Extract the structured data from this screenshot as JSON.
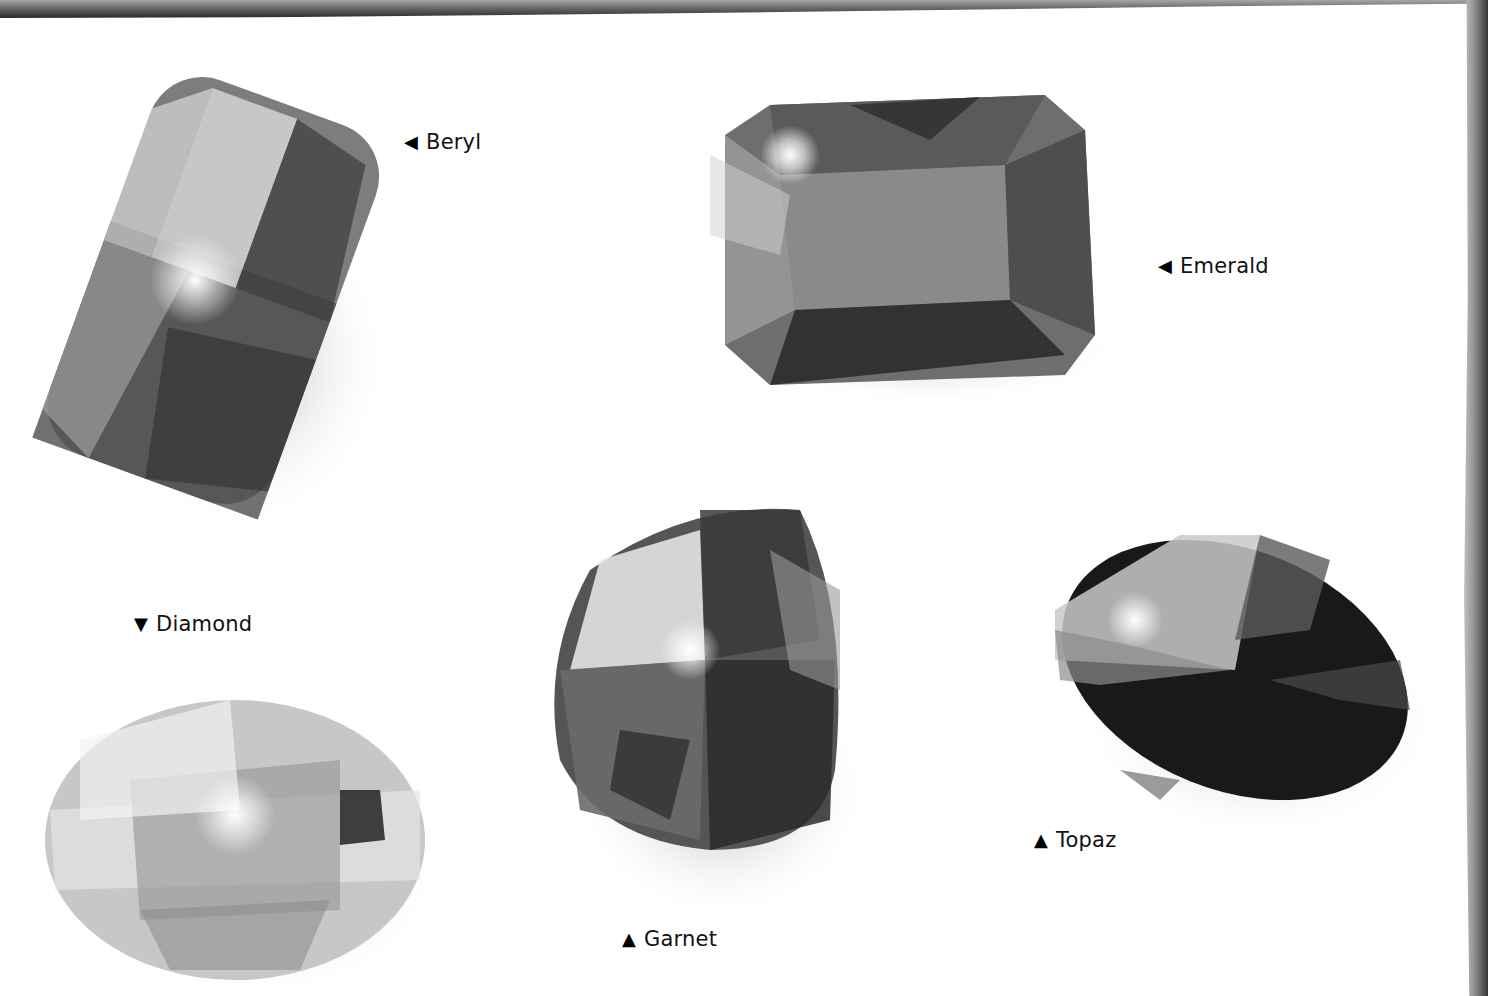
{
  "page": {
    "border_color": "#4a4a4a",
    "background": "#ffffff"
  },
  "gems": [
    {
      "id": "beryl",
      "label": "Beryl",
      "pointer": "◀",
      "pointer_icon": "triangle-left-icon",
      "shape": "rounded-rectangle-tilted",
      "tone": "medium-gray"
    },
    {
      "id": "emerald",
      "label": "Emerald",
      "pointer": "◀",
      "pointer_icon": "triangle-left-icon",
      "shape": "octagon-emerald-cut",
      "tone": "dark-gray"
    },
    {
      "id": "diamond",
      "label": "Diamond",
      "pointer": "▼",
      "pointer_icon": "triangle-down-icon",
      "shape": "oval",
      "tone": "light-gray"
    },
    {
      "id": "garnet",
      "label": "Garnet",
      "pointer": "▲",
      "pointer_icon": "triangle-up-icon",
      "shape": "cushion",
      "tone": "dark-gray"
    },
    {
      "id": "topaz",
      "label": "Topaz",
      "pointer": "▲",
      "pointer_icon": "triangle-up-icon",
      "shape": "oval-tilted",
      "tone": "very-dark"
    }
  ]
}
